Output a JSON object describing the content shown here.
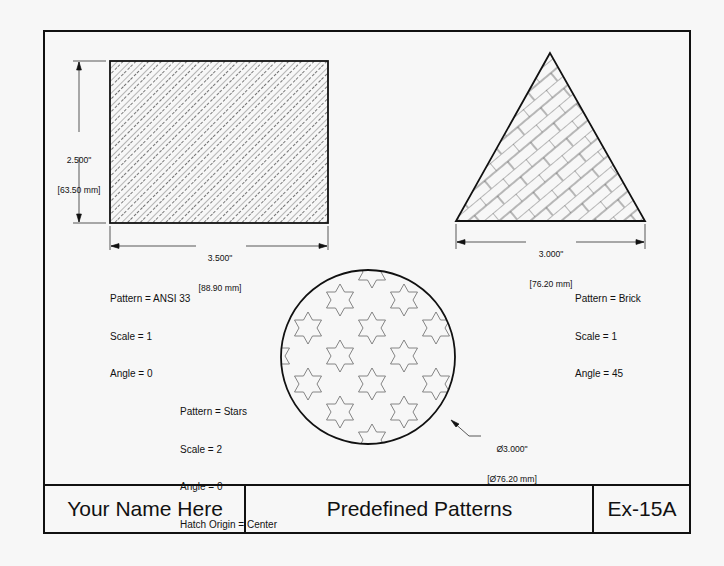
{
  "drawing": {
    "title_block": {
      "name": "Your Name Here",
      "title": "Predefined Patterns",
      "number": "Ex-15A"
    },
    "rectangle": {
      "pattern_label": "Pattern = ANSI 33",
      "scale_label": "Scale = 1",
      "angle_label": "Angle = 0",
      "height_dim_in": "2.500\"",
      "height_dim_mm": "[63.50 mm]",
      "width_dim_in": "3.500\"",
      "width_dim_mm": "[88.90 mm]"
    },
    "triangle": {
      "pattern_label": "Pattern = Brick",
      "scale_label": "Scale = 1",
      "angle_label": "Angle = 45",
      "base_dim_in": "3.000\"",
      "base_dim_mm": "[76.20 mm]"
    },
    "circle": {
      "pattern_label": "Pattern = Stars",
      "scale_label": "Scale = 2",
      "angle_label": "Angle = 0",
      "origin_label": "Hatch Origin = Center",
      "diameter_dim_in": "Ø3.000\"",
      "diameter_dim_mm": "[Ø76.20 mm]"
    },
    "colors": {
      "line": "#111111",
      "hatch": "#555555",
      "paper": "#f7f7f7"
    }
  }
}
